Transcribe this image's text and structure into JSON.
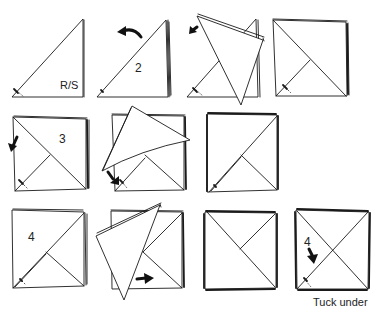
{
  "diagram": {
    "colors": {
      "ink": "#1a1a1a",
      "paper": "#ffffff",
      "background": "#ffffff"
    },
    "rows": [
      {
        "panels": [
          {
            "id": "r1p1",
            "label": "R/S",
            "description": "napkin folded into triangle, right side"
          },
          {
            "id": "r1p2",
            "label": "2",
            "arrow": "curved-arrow-left",
            "description": "layered triangle, fold top corner left"
          },
          {
            "id": "r1p3",
            "label": "",
            "arrow": "arrow-down-left",
            "description": "top flap folding over"
          },
          {
            "id": "r1p4",
            "label": "",
            "description": "flap folded down forming square"
          }
        ]
      },
      {
        "panels": [
          {
            "id": "r2p1",
            "label": "3",
            "arrow": "arrow-down",
            "description": "square with diagonal, fold next corner"
          },
          {
            "id": "r2p2",
            "label": "",
            "arrow": "arrow-down-right",
            "description": "flap lifting and folding down"
          },
          {
            "id": "r2p3",
            "label": "",
            "description": "square with opposite diagonal"
          }
        ]
      },
      {
        "panels": [
          {
            "id": "r3p1",
            "label": "4",
            "description": "square with diagonal, step 4"
          },
          {
            "id": "r3p2",
            "label": "",
            "arrow": "arrow-right",
            "description": "flap folding across"
          },
          {
            "id": "r3p3",
            "label": "",
            "description": "square with diagonal fold"
          },
          {
            "id": "r3p4",
            "label": "4",
            "arrow": "arrow-down",
            "caption": "Tuck under",
            "description": "crossed diagonals, tuck under"
          }
        ]
      }
    ],
    "labels": {
      "rs": "R/S",
      "step2": "2",
      "step3": "3",
      "step4a": "4",
      "step4b": "4",
      "tuck_under": "Tuck under"
    }
  }
}
